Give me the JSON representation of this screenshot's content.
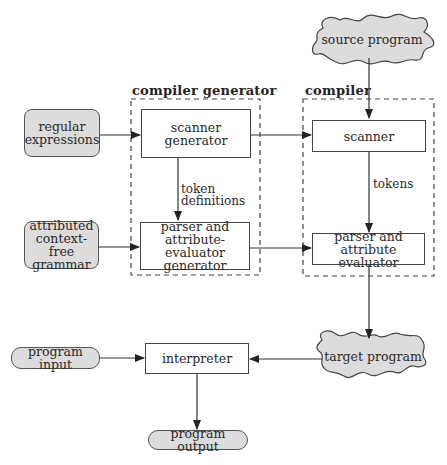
{
  "diagram": {
    "groups": {
      "compiler_generator": {
        "title": "compiler generator"
      },
      "compiler": {
        "title": "compiler"
      }
    },
    "inputs": {
      "regular_expressions": {
        "line1": "regular",
        "line2": "expressions"
      },
      "attributed_grammar": {
        "line1": "attributed",
        "line2": "context-free",
        "line3": "grammar"
      },
      "program_input": {
        "label": "program input"
      }
    },
    "outputs": {
      "program_output": {
        "label": "program output"
      }
    },
    "clouds": {
      "source_program": {
        "label": "source program"
      },
      "target_program": {
        "label": "target program"
      }
    },
    "components": {
      "scanner_generator": {
        "line1": "scanner",
        "line2": "generator"
      },
      "parser_generator": {
        "line1": "parser and",
        "line2": "attribute-evaluator",
        "line3": "generator"
      },
      "scanner": {
        "label": "scanner"
      },
      "parser_evaluator": {
        "line1": "parser and",
        "line2": "attribute evaluator"
      },
      "interpreter": {
        "label": "interpreter"
      }
    },
    "edge_labels": {
      "token_definitions": {
        "line1": "token",
        "line2": "definitions"
      },
      "tokens": {
        "label": "tokens"
      }
    },
    "colors": {
      "fill_gray": "#dcdcdc",
      "stroke": "#444444",
      "background": "#ffffff"
    }
  }
}
